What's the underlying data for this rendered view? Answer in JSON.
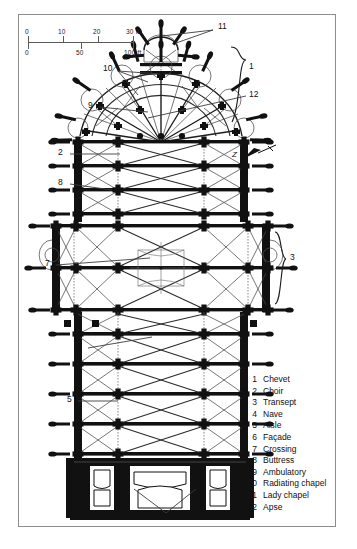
{
  "figure": {
    "type": "architectural-floor-plan"
  },
  "scale_bar": {
    "metric_unit": "m",
    "imperial_unit": "ft",
    "metric_ticks": [
      "0",
      "10",
      "20",
      "30 m"
    ],
    "imperial_ticks": [
      "0",
      "50",
      "100 ft"
    ],
    "metric_0": "0",
    "metric_10": "10",
    "metric_20": "20",
    "metric_30": "30 m",
    "imperial_0": "0",
    "imperial_50": "50",
    "imperial_100": "100 ft"
  },
  "north_arrow": {
    "label": "Z"
  },
  "callouts": {
    "c1": "1",
    "c2": "2",
    "c3": "3",
    "c4": "4",
    "c5": "5",
    "c6": "6",
    "c7": "7",
    "c8": "8",
    "c9": "9",
    "c10": "10",
    "c11": "11",
    "c12": "12"
  },
  "legend": {
    "items": [
      {
        "num": "1",
        "label": "Chevet"
      },
      {
        "num": "2",
        "label": "Choir"
      },
      {
        "num": "3",
        "label": "Transept"
      },
      {
        "num": "4",
        "label": "Nave"
      },
      {
        "num": "5",
        "label": "Aisle"
      },
      {
        "num": "6",
        "label": "Façade"
      },
      {
        "num": "7",
        "label": "Crossing"
      },
      {
        "num": "8",
        "label": "Buttress"
      },
      {
        "num": "9",
        "label": "Ambulatory"
      },
      {
        "num": "10",
        "label": "Radiating chapel"
      },
      {
        "num": "11",
        "label": "Lady chapel"
      },
      {
        "num": "12",
        "label": "Apse"
      }
    ]
  },
  "colors": {
    "ink": "#111111",
    "frame": "#8d8d8d",
    "leader": "#3c3c3c",
    "masonry": "#111111",
    "vault_line": "#4a4a4a",
    "background": "#ffffff"
  }
}
